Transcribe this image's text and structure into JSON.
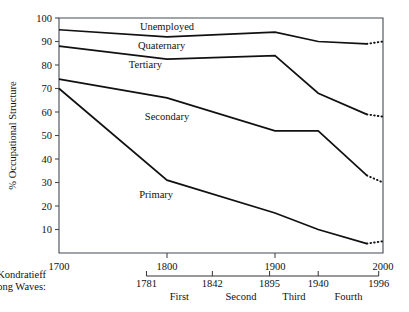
{
  "chart_data": {
    "type": "line",
    "title": "",
    "xlabel": "",
    "ylabel": "% Occupational Structure",
    "xlim": [
      1700,
      2000
    ],
    "ylim": [
      0,
      100
    ],
    "grid": false,
    "legend_position": "inline-annotations",
    "y_ticks": [
      100,
      90,
      80,
      70,
      60,
      50,
      40,
      30,
      20,
      10
    ],
    "x_ticks": [
      1700,
      1800,
      1900,
      2000
    ],
    "x_tick_labels": [
      "1700",
      "1800",
      "1900",
      "2000"
    ],
    "y_tick_labels": [
      "100",
      "90",
      "80",
      "70",
      "60",
      "50",
      "40",
      "30",
      "20",
      "10"
    ],
    "note": "Cumulative boundary lines dividing occupational sectors; dotted segments at the right end are projections.",
    "series": [
      {
        "name": "Unemployed lower boundary",
        "x": [
          1700,
          1800,
          1900,
          1940,
          1985
        ],
        "values": [
          95,
          92,
          94,
          90,
          89
        ],
        "projection_x": [
          1985,
          2000
        ],
        "projection_values": [
          89,
          90
        ]
      },
      {
        "name": "Quaternary lower boundary",
        "x": [
          1700,
          1800,
          1900,
          1940,
          1985
        ],
        "values": [
          88,
          82.5,
          84,
          68,
          59
        ],
        "projection_x": [
          1985,
          2000
        ],
        "projection_values": [
          59,
          58
        ]
      },
      {
        "name": "Tertiary lower boundary",
        "x": [
          1700,
          1800,
          1900,
          1940,
          1985
        ],
        "values": [
          74,
          66,
          52,
          52,
          33
        ],
        "projection_x": [
          1985,
          2000
        ],
        "projection_values": [
          33,
          30
        ]
      },
      {
        "name": "Secondary lower boundary",
        "x": [
          1700,
          1800,
          1900,
          1940,
          1985
        ],
        "values": [
          70,
          31,
          17,
          10,
          4
        ],
        "projection_x": [
          1985,
          2000
        ],
        "projection_values": [
          4,
          5
        ]
      }
    ],
    "region_labels": [
      {
        "label": "Unemployed",
        "x": 1800,
        "y": 96.5
      },
      {
        "label": "Quaternary",
        "x": 1795,
        "y": 88.5
      },
      {
        "label": "Tertiary",
        "x": 1780,
        "y": 80.5
      },
      {
        "label": "Secondary",
        "x": 1800,
        "y": 58
      },
      {
        "label": "Primary",
        "x": 1790,
        "y": 25
      }
    ],
    "secondary_axis": {
      "title_line1": "Kondratieff",
      "title_line2": "Long Waves:",
      "ticks": [
        1781,
        1842,
        1895,
        1940,
        1996
      ],
      "tick_labels": [
        "1781",
        "1842",
        "1895",
        "1940",
        "1996"
      ],
      "wave_labels": [
        "First",
        "Second",
        "Third",
        "Fourth"
      ]
    }
  }
}
